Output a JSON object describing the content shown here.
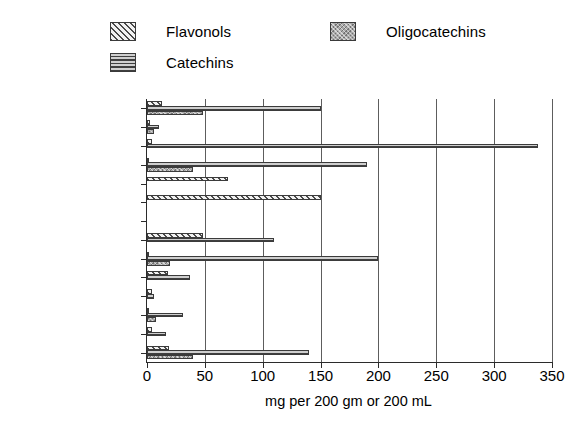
{
  "legend": {
    "items": [
      {
        "key": "flavonols",
        "label": "Flavonols",
        "pattern": "diagonal-hatch",
        "color": "#f2f2f2"
      },
      {
        "key": "catechins",
        "label": "Catechins",
        "pattern": "horizontal-hatch",
        "color": "#cfcfcf"
      },
      {
        "key": "oligocatechins",
        "label": "Oligocatechins",
        "pattern": "crosshatch",
        "color": "#a9a9a9"
      }
    ]
  },
  "axis": {
    "x_title": "mg per 200 gm or 200 mL",
    "x_ticks": [
      "0",
      "50",
      "100",
      "150",
      "200",
      "250",
      "300",
      "350"
    ]
  },
  "chart_data": {
    "type": "bar",
    "orientation": "horizontal",
    "title": "",
    "xlabel": "mg per 200 gm or 200 mL",
    "ylabel": "",
    "xlim": [
      0,
      350
    ],
    "xticks": [
      0,
      50,
      100,
      150,
      200,
      250,
      300,
      350
    ],
    "grid": true,
    "legend_position": "top",
    "categories": [
      "Wine, Red",
      "Wine, White",
      "Tea, Green",
      "Tea, Black",
      "Onion",
      "Orange",
      "Blueberry",
      "Strawberry",
      "Peach",
      "Apricot",
      "Plum",
      "Cherry, Sweet",
      "Pear",
      "Apple"
    ],
    "series": [
      {
        "name": "Flavonols",
        "values": [
          13,
          3,
          4,
          2,
          70,
          150,
          0,
          48,
          2,
          18,
          4,
          2,
          4,
          19
        ]
      },
      {
        "name": "Catechins",
        "values": [
          150,
          10,
          338,
          190,
          0,
          0,
          0,
          110,
          200,
          37,
          6,
          31,
          16,
          140
        ]
      },
      {
        "name": "Oligocatechins",
        "values": [
          48,
          6,
          0,
          40,
          0,
          0,
          0,
          0,
          20,
          0,
          0,
          8,
          0,
          40
        ]
      }
    ]
  }
}
